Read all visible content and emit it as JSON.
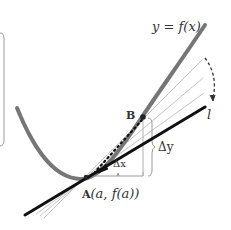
{
  "diagram": {
    "labels": {
      "curve": "y = f(x)",
      "point_b": "B",
      "point_a_name": "A",
      "point_a_coords": "(a, f(a))",
      "delta_x": "Δx",
      "delta_y": "Δy",
      "tangent": "l"
    },
    "colors": {
      "curve": "#707070",
      "tangent": "#111111",
      "secant": "#bdbdbd",
      "bracket": "#9a9a9a",
      "text": "#333333",
      "background": "#ffffff"
    }
  }
}
